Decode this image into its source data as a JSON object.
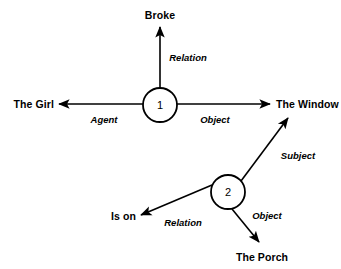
{
  "diagram": {
    "ink_color": "#000000",
    "background_color": "#ffffff",
    "nodes": [
      {
        "id": "node-1",
        "label": "1",
        "cx": 160,
        "cy": 105,
        "r": 17
      },
      {
        "id": "node-2",
        "label": "2",
        "cx": 228,
        "cy": 192,
        "r": 17
      }
    ],
    "terms": [
      {
        "id": "term-broke",
        "text": "Broke",
        "x": 160,
        "y": 15,
        "align": "center"
      },
      {
        "id": "term-the-girl",
        "text": "The Girl",
        "x": 54,
        "y": 104,
        "align": "right"
      },
      {
        "id": "term-the-window",
        "text": "The Window",
        "x": 276,
        "y": 104,
        "align": "left"
      },
      {
        "id": "term-is-on",
        "text": "Is on",
        "x": 136,
        "y": 216,
        "align": "right"
      },
      {
        "id": "term-the-porch",
        "text": "The Porch",
        "x": 262,
        "y": 257,
        "align": "center"
      }
    ],
    "edges": [
      {
        "id": "edge-relation-broke",
        "from": "node-1",
        "to": "term-broke",
        "label": "Relation",
        "label_x": 188,
        "label_y": 57
      },
      {
        "id": "edge-agent-girl",
        "from": "node-1",
        "to": "term-the-girl",
        "label": "Agent",
        "label_x": 104,
        "label_y": 119
      },
      {
        "id": "edge-object-window",
        "from": "node-1",
        "to": "term-the-window",
        "label": "Object",
        "label_x": 215,
        "label_y": 119
      },
      {
        "id": "edge-subject-window",
        "from": "node-2",
        "to": "term-the-window",
        "label": "Subject",
        "label_x": 298,
        "label_y": 155
      },
      {
        "id": "edge-relation-is-on",
        "from": "node-2",
        "to": "term-is-on",
        "label": "Relation",
        "label_x": 183,
        "label_y": 222
      },
      {
        "id": "edge-object-porch",
        "from": "node-2",
        "to": "term-the-porch",
        "label": "Object",
        "label_x": 267,
        "label_y": 215
      }
    ]
  }
}
